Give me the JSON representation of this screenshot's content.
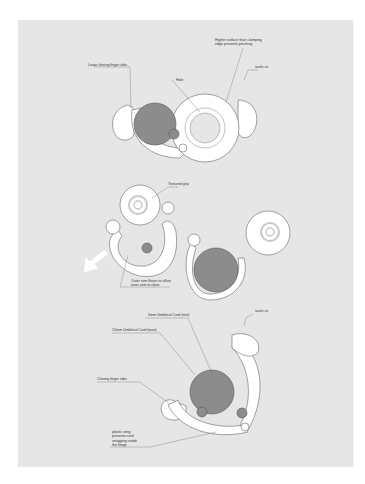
{
  "figure1": {
    "labels": {
      "higher_surface": "Higher surface than clamping\nedge prevents pinching",
      "large_tabs": "Large closing finger tabs",
      "hole": "Hole",
      "scale": "scale xx"
    }
  },
  "figure2": {
    "labels": {
      "textured_grip": "Textured grip",
      "outer_arm": "Outer arm flexes to allow\ninner arm to close"
    }
  },
  "figure3": {
    "labels": {
      "mm_large": "5mm Umbilical Cord (min)",
      "mm_max": "15mm Umbilical Cord (max)",
      "closing_tabs": "Closing finger tabs",
      "plastic_wing": "plastic wing\nprevents cord\nsnagging inside\nthe hinge",
      "scale": "scale xx"
    }
  },
  "colors": {
    "panel": "#e6e6e6",
    "cord": "#8c8c8c",
    "outline": "#555555",
    "fill": "#ffffff",
    "ring": "#c8c8c8"
  }
}
